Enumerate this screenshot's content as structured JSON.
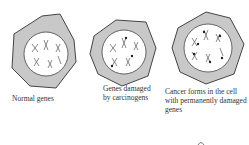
{
  "cells": [
    {
      "label": "Normal genes",
      "state": "normal"
    },
    {
      "label_lines": [
        "Genes damaged",
        "by carcinogens"
      ],
      "state": "damaged"
    },
    {
      "label_lines": [
        "Cancer forms in the cell",
        "with permanently damaged",
        "genes"
      ],
      "state": "cancer"
    }
  ]
}
